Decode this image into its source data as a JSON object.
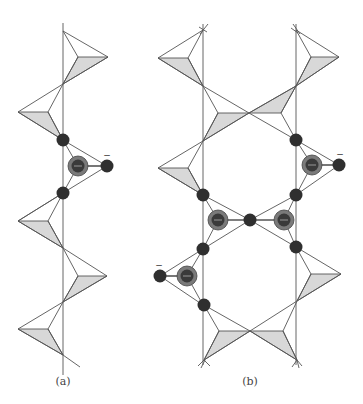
{
  "figure": {
    "panels": [
      {
        "id": "a",
        "label": "(a)",
        "label_pos": [
          63,
          376
        ]
      },
      {
        "id": "b",
        "label": "(b)",
        "label_pos": [
          250,
          376
        ]
      }
    ],
    "colors": {
      "line": "#555555",
      "shade": "#d8d8d8",
      "atom": "#2f2f2f",
      "ring_outer": "#7a7a7a",
      "ring_inner": "#3a3a3a",
      "background": "#ffffff"
    },
    "charges": [
      {
        "text": "−",
        "pos": [
          107,
          155
        ]
      },
      {
        "text": "−",
        "pos": [
          340,
          154
        ]
      },
      {
        "text": "−",
        "pos": [
          159,
          265
        ]
      }
    ],
    "ring_symbol": "−"
  }
}
